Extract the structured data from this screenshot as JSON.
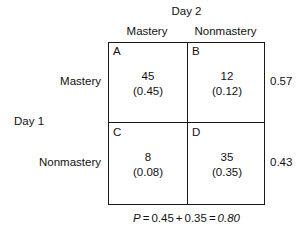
{
  "figure": {
    "column_axis_title": "Day 2",
    "row_axis_title": "Day 1",
    "column_headers": [
      "Mastery",
      "Nonmastery"
    ],
    "row_headers": [
      "Mastery",
      "Nonmastery"
    ],
    "cells": [
      {
        "letter": "A",
        "count": "45",
        "proportion": "(0.45)"
      },
      {
        "letter": "B",
        "count": "12",
        "proportion": "(0.12)"
      },
      {
        "letter": "C",
        "count": "8",
        "proportion": "(0.08)"
      },
      {
        "letter": "D",
        "count": "35",
        "proportion": "(0.35)"
      }
    ],
    "row_margins": [
      "0.57",
      "0.43"
    ],
    "formula": {
      "symbol": "P",
      "equals_1": "=",
      "term_1": "0.45",
      "plus": "+",
      "term_2": "0.35",
      "equals_2": "=",
      "result": "0.80"
    },
    "colors": {
      "border": "#1a1a1a",
      "text": "#111111",
      "background": "#ffffff"
    }
  },
  "chart_data": {
    "type": "table",
    "xlabel": "Day 2",
    "ylabel": "Day 1",
    "columns": [
      "Mastery",
      "Nonmastery"
    ],
    "rows": [
      "Mastery",
      "Nonmastery"
    ],
    "cell_labels": [
      [
        "A",
        "B"
      ],
      [
        "C",
        "D"
      ]
    ],
    "counts": [
      [
        45,
        12
      ],
      [
        8,
        35
      ]
    ],
    "proportions": [
      [
        0.45,
        0.12
      ],
      [
        0.08,
        0.35
      ]
    ],
    "row_margin_proportions": [
      0.57,
      0.43
    ],
    "agreement_proportion": 0.8,
    "annotation": "P = 0.45 + 0.35 = 0.80",
    "grid": true,
    "legend": "none"
  }
}
